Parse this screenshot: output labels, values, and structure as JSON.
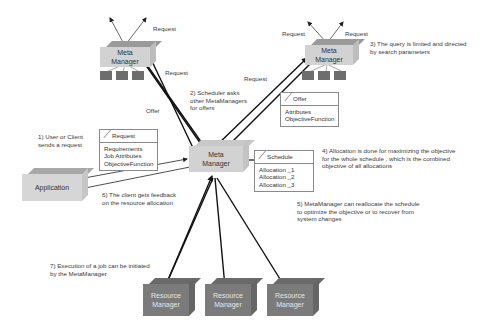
{
  "nodes": {
    "meta_top_left": {
      "line1": "Meta",
      "line2": "Manager"
    },
    "meta_top_right": {
      "line1": "Meta",
      "line2": "Manager"
    },
    "meta_center": {
      "line1": "Meta",
      "line2": "Manager"
    },
    "application": {
      "label": "Application"
    },
    "resource_managers": [
      {
        "line1": "Resource",
        "line2": "Manager"
      },
      {
        "line1": "Resource",
        "line2": "Manager"
      },
      {
        "line1": "Resource",
        "line2": "Manager"
      }
    ]
  },
  "edge_labels": {
    "request_tl": "Request",
    "request_tl_in": "Request",
    "request_tr_left": "Request",
    "request_tr_right": "Request",
    "request_tr_in": "Request",
    "offer": "Offer"
  },
  "cards": {
    "request": {
      "title": "Request",
      "items": [
        "Requirements",
        "Job Attributes",
        "ObjectiveFunction"
      ]
    },
    "offer": {
      "title": "Offer",
      "items": [
        "Attributes",
        "ObjectiveFunction"
      ]
    },
    "schedule": {
      "title": "Schedule",
      "items": [
        "Allocation _1",
        "Allocation _2",
        "Allocation _3"
      ]
    }
  },
  "steps": {
    "s1": [
      "1) User or Client",
      "sends a request"
    ],
    "s2": [
      "2) Scheduler asks",
      "other MetaManagers",
      "for offers"
    ],
    "s3": [
      "3) The query is limited and directed",
      "by search parameters"
    ],
    "s4": [
      "4) Allocation is done for maximizing the objective",
      "for the whole schedule , which is the combined",
      "objective of all allocations"
    ],
    "s5": [
      "5) MetaManager can reallocate the schedule",
      "to optimize the objective or  to recover from",
      "system changes"
    ],
    "s6": [
      "6) The client gets feedback",
      "on the resource allocation"
    ],
    "s7": [
      "7) Execution of a job can be initiated",
      "by the MetaManager"
    ]
  }
}
